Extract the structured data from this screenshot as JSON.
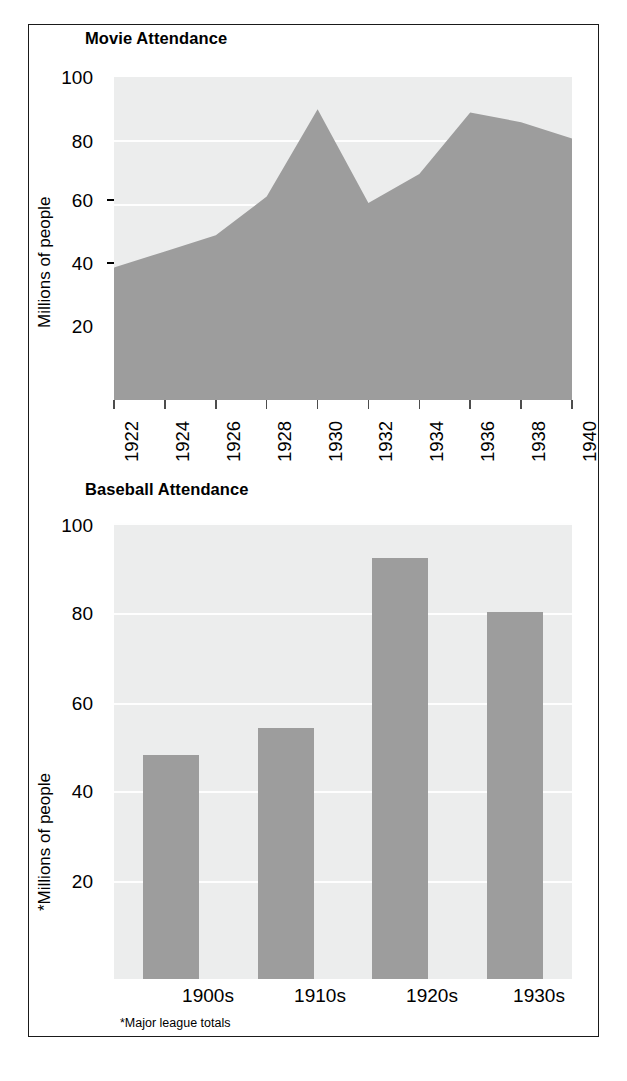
{
  "figure": {
    "background_color": "#ffffff",
    "border_color": "#1a1a1a",
    "series_color": "#9d9d9d",
    "plot_background_color": "#eceded",
    "gridline_color": "#ffffff"
  },
  "charts": [
    {
      "id": "movie-attendance",
      "title": "Movie Attendance",
      "ylabel": "Millions of people",
      "ytick_labels": [
        "100",
        "80",
        "60",
        "40",
        "20"
      ],
      "xtick_labels": [
        "1922",
        "1924",
        "1926",
        "1928",
        "1930",
        "1932",
        "1934",
        "1936",
        "1938",
        "1940"
      ]
    },
    {
      "id": "baseball-attendance",
      "title": "Baseball Attendance",
      "ylabel": "*Millions of people",
      "ytick_labels": [
        "100",
        "80",
        "60",
        "40",
        "20"
      ],
      "xtick_labels": [
        "1900s",
        "1910s",
        "1920s",
        "1930s"
      ],
      "footnote": "*Major league totals"
    }
  ],
  "chart_data": [
    {
      "type": "area",
      "title": "Movie Attendance",
      "xlabel": "",
      "ylabel": "Millions of people",
      "x": [
        1922,
        1924,
        1926,
        1928,
        1930,
        1932,
        1934,
        1936,
        1938,
        1940
      ],
      "categories": [
        "1922",
        "1924",
        "1926",
        "1928",
        "1930",
        "1932",
        "1934",
        "1936",
        "1938",
        "1940"
      ],
      "values": [
        41,
        46,
        51,
        63,
        90,
        61,
        70,
        89,
        86,
        81
      ],
      "ylim": [
        0,
        100
      ],
      "yticks": [
        20,
        40,
        60,
        80,
        100
      ],
      "grid": true,
      "legend": "none"
    },
    {
      "type": "bar",
      "title": "Baseball Attendance",
      "xlabel": "",
      "ylabel": "*Millions of people",
      "categories": [
        "1900s",
        "1910s",
        "1920s",
        "1930s"
      ],
      "values": [
        50,
        56,
        94,
        82
      ],
      "ylim": [
        0,
        100
      ],
      "yticks": [
        20,
        40,
        60,
        80,
        100
      ],
      "grid": true,
      "legend": "none",
      "note": "*Major league totals"
    }
  ]
}
